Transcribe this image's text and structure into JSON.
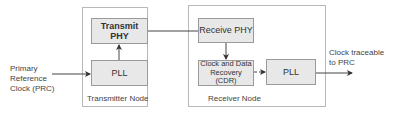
{
  "diagram": {
    "input_label": [
      "Primary",
      "Reference",
      "Clock (PRC)"
    ],
    "output_label": [
      "Clock traceable",
      "to PRC"
    ],
    "transmitter": {
      "title": "Transmitter Node",
      "blocks": {
        "phy": "Transmit PHY",
        "pll": "PLL"
      }
    },
    "receiver": {
      "title": "Receiver Node",
      "blocks": {
        "phy": "Receive PHY",
        "cdr_line1": "Clock and Data",
        "cdr_line2": "Recovery (CDR)",
        "pll": "PLL"
      }
    },
    "colors": {
      "block_fill": "#e8e8e8",
      "block_border": "#9a9a9a",
      "node_border": "#b8b8b8",
      "line": "#444444"
    }
  }
}
